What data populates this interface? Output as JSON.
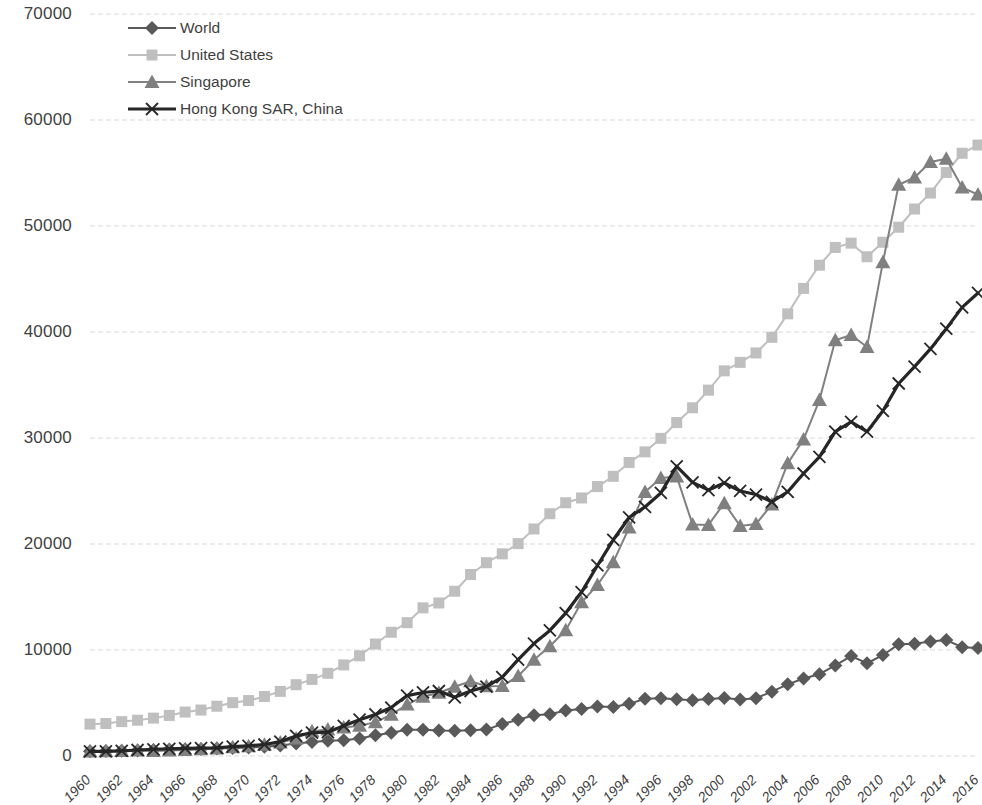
{
  "chart_data": {
    "type": "line",
    "title": "",
    "subtitle": "",
    "xlabel": "",
    "ylabel": "",
    "xlim": [
      1960,
      2016
    ],
    "ylim": [
      0,
      70000
    ],
    "y_ticks": [
      0,
      10000,
      20000,
      30000,
      40000,
      50000,
      60000,
      70000
    ],
    "y_tick_labels": [
      "0",
      "10000",
      "20000",
      "30000",
      "40000",
      "50000",
      "60000",
      "70000"
    ],
    "x_ticks": [
      1960,
      1962,
      1964,
      1966,
      1968,
      1970,
      1972,
      1974,
      1976,
      1978,
      1980,
      1982,
      1984,
      1986,
      1988,
      1990,
      1992,
      1994,
      1996,
      1998,
      2000,
      2002,
      2004,
      2006,
      2008,
      2010,
      2012,
      2014,
      2016
    ],
    "x_tick_labels": [
      "1960",
      "1962",
      "1964",
      "1966",
      "1968",
      "1970",
      "1972",
      "1974",
      "1976",
      "1978",
      "1980",
      "1982",
      "1984",
      "1986",
      "1988",
      "1990",
      "1992",
      "1994",
      "1996",
      "1998",
      "2000",
      "2002",
      "2004",
      "2006",
      "2008",
      "2010",
      "2012",
      "2014",
      "2016"
    ],
    "grid": "horizontal",
    "legend_position": "top-left",
    "x": [
      1960,
      1961,
      1962,
      1963,
      1964,
      1965,
      1966,
      1967,
      1968,
      1969,
      1970,
      1971,
      1972,
      1973,
      1974,
      1975,
      1976,
      1977,
      1978,
      1979,
      1980,
      1981,
      1982,
      1983,
      1984,
      1985,
      1986,
      1987,
      1988,
      1989,
      1990,
      1991,
      1992,
      1993,
      1994,
      1995,
      1996,
      1997,
      1998,
      1999,
      2000,
      2001,
      2002,
      2003,
      2004,
      2005,
      2006,
      2007,
      2008,
      2009,
      2010,
      2011,
      2012,
      2013,
      2014,
      2015,
      2016
    ],
    "series": [
      {
        "name": "World",
        "color": "#595959",
        "marker": "diamond",
        "line_width": 2,
        "values": [
          450,
          465,
          495,
          525,
          570,
          605,
          645,
          665,
          700,
          760,
          810,
          880,
          1000,
          1180,
          1320,
          1440,
          1490,
          1660,
          1950,
          2200,
          2480,
          2480,
          2400,
          2380,
          2420,
          2490,
          3020,
          3420,
          3840,
          3930,
          4290,
          4430,
          4670,
          4630,
          4920,
          5400,
          5440,
          5350,
          5260,
          5380,
          5470,
          5330,
          5450,
          6070,
          6760,
          7310,
          7720,
          8540,
          9430,
          8750,
          9520,
          10540,
          10600,
          10800,
          10940,
          10270,
          10200
        ]
      },
      {
        "name": "United States",
        "color": "#bfbfbf",
        "marker": "square",
        "line_width": 2,
        "values": [
          3007,
          3067,
          3244,
          3375,
          3574,
          3828,
          4146,
          4336,
          4696,
          5032,
          5234,
          5609,
          6094,
          6726,
          7226,
          7801,
          8592,
          9453,
          10565,
          11674,
          12575,
          13976,
          14434,
          15544,
          17121,
          18237,
          19071,
          20039,
          21417,
          22857,
          23889,
          24342,
          25419,
          26387,
          27695,
          28691,
          29968,
          31459,
          32854,
          34515,
          36335,
          37134,
          38023,
          39496,
          41713,
          44115,
          46299,
          47976,
          48383,
          47100,
          48466,
          49883,
          51603,
          53107,
          55050,
          56863,
          57638
        ]
      },
      {
        "name": "Singapore",
        "color": "#808080",
        "marker": "triangle",
        "line_width": 2,
        "values": [
          428,
          450,
          472,
          512,
          465,
          517,
          570,
          627,
          713,
          819,
          926,
          1071,
          1264,
          1659,
          2343,
          2500,
          2681,
          2846,
          3194,
          3902,
          4859,
          5595,
          5964,
          6527,
          7048,
          6588,
          6593,
          7550,
          9071,
          10360,
          11862,
          14500,
          16136,
          18290,
          21552,
          24915,
          26234,
          26376,
          21829,
          21797,
          23853,
          21700,
          21886,
          23730,
          27609,
          29870,
          33580,
          39224,
          39721,
          38577,
          46570,
          53890,
          54578,
          56029,
          56336,
          53630,
          52961
        ]
      },
      {
        "name": "Hong Kong SAR, China",
        "color": "#262626",
        "marker": "x",
        "line_width": 3.2,
        "values": [
          429,
          441,
          492,
          566,
          635,
          677,
          711,
          747,
          771,
          893,
          960,
          1085,
          1362,
          1895,
          2195,
          2251,
          2850,
          3429,
          3924,
          4569,
          5700,
          5992,
          6133,
          5536,
          6133,
          6542,
          7443,
          9093,
          10610,
          11848,
          13486,
          15466,
          17976,
          20396,
          22503,
          23497,
          24818,
          27330,
          25809,
          25092,
          25757,
          25003,
          24666,
          23977,
          24928,
          26650,
          28224,
          30594,
          31516,
          30594,
          32550,
          35142,
          36731,
          38404,
          40315,
          42327,
          43681
        ]
      }
    ]
  },
  "legend": {
    "items": [
      {
        "label": "World"
      },
      {
        "label": "United States"
      },
      {
        "label": "Singapore"
      },
      {
        "label": "Hong Kong SAR, China"
      }
    ]
  }
}
